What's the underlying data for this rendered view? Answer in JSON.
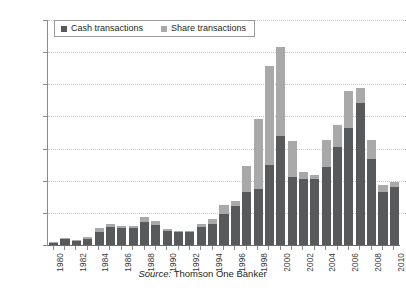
{
  "title": "",
  "source": {
    "label": "Source:",
    "text": "Thomson One Banker"
  },
  "legend": {
    "position": "top-left-inside",
    "items": [
      {
        "label": "Cash transactions",
        "color": "#58595b"
      },
      {
        "label": "Share transactions",
        "color": "#a9a9a9"
      }
    ]
  },
  "axes": {
    "y_ticks": [
      "0",
      "500",
      "1000",
      "1500",
      "2000",
      "2500",
      "3000",
      "3500"
    ],
    "x_ticks": [
      "1980",
      "1982",
      "1984",
      "1986",
      "1988",
      "1990",
      "1992",
      "1994",
      "1996",
      "1998",
      "2000",
      "2002",
      "2004",
      "2006",
      "2008",
      "2010"
    ]
  },
  "chart_data": {
    "type": "bar",
    "stacked": true,
    "title": "",
    "xlabel": "",
    "ylabel": "",
    "ylim": [
      0,
      3500
    ],
    "ytick_step": 500,
    "grid": true,
    "legend_position": "top-left-inside",
    "categories": [
      "1980",
      "1981",
      "1982",
      "1983",
      "1984",
      "1985",
      "1986",
      "1987",
      "1988",
      "1989",
      "1990",
      "1991",
      "1992",
      "1993",
      "1994",
      "1995",
      "1996",
      "1997",
      "1998",
      "1999",
      "2000",
      "2001",
      "2002",
      "2003",
      "2004",
      "2005",
      "2006",
      "2007",
      "2008",
      "2009",
      "2010"
    ],
    "series": [
      {
        "name": "Cash transactions",
        "color": "#58595b",
        "values": [
          30,
          90,
          60,
          100,
          200,
          280,
          270,
          270,
          360,
          310,
          220,
          200,
          200,
          280,
          330,
          480,
          600,
          830,
          870,
          1250,
          1700,
          1060,
          1030,
          1020,
          1220,
          1530,
          1820,
          2210,
          1340,
          830,
          900
        ]
      },
      {
        "name": "Share transactions",
        "color": "#a9a9a9",
        "values": [
          10,
          20,
          15,
          20,
          60,
          40,
          30,
          30,
          70,
          60,
          30,
          20,
          20,
          50,
          70,
          150,
          80,
          400,
          1090,
          1530,
          1380,
          560,
          100,
          70,
          420,
          330,
          580,
          240,
          290,
          110,
          80
        ]
      }
    ],
    "totals": [
      40,
      110,
      75,
      120,
      260,
      320,
      300,
      300,
      430,
      370,
      250,
      220,
      220,
      330,
      400,
      630,
      680,
      1230,
      1960,
      2780,
      3080,
      1620,
      1130,
      1090,
      1640,
      1860,
      2400,
      2450,
      1630,
      940,
      980
    ]
  }
}
